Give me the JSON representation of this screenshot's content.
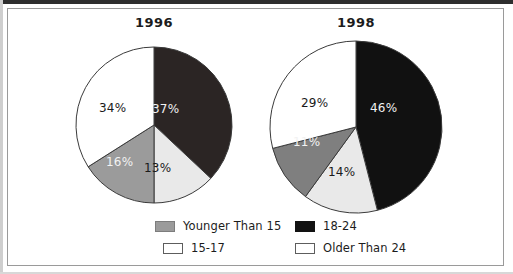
{
  "chart_data": [
    {
      "type": "pie",
      "title": "1996",
      "categories": [
        "18-24",
        "15-17",
        "Younger Than 15",
        "Older Than 24"
      ],
      "values": [
        37,
        13,
        16,
        34
      ],
      "labels": [
        "37%",
        "13%",
        "16%",
        "34%"
      ],
      "colors": [
        "#2b2524",
        "#e9e9e9",
        "#9b9b9b",
        "#ffffff"
      ],
      "label_colors": [
        "light",
        "dark",
        "light",
        "dark"
      ],
      "start_angle_deg": 0,
      "direction": "clockwise",
      "units": "percent",
      "legend_position": "bottom"
    },
    {
      "type": "pie",
      "title": "1998",
      "categories": [
        "18-24",
        "15-17",
        "Younger Than 15",
        "Older Than 24"
      ],
      "values": [
        46,
        14,
        11,
        29
      ],
      "labels": [
        "46%",
        "14%",
        "11%",
        "29%"
      ],
      "colors": [
        "#111111",
        "#e9e9e9",
        "#7f7f7f",
        "#ffffff"
      ],
      "label_colors": [
        "light",
        "dark",
        "light",
        "dark"
      ],
      "start_angle_deg": 0,
      "direction": "clockwise",
      "units": "percent",
      "legend_position": "bottom"
    }
  ],
  "charts": {
    "left": {
      "title": "1996",
      "slices": [
        {
          "label": "37%",
          "value": 37,
          "category": "18-24"
        },
        {
          "label": "13%",
          "value": 13,
          "category": "15-17"
        },
        {
          "label": "16%",
          "value": 16,
          "category": "Younger Than 15"
        },
        {
          "label": "34%",
          "value": 34,
          "category": "Older Than 24"
        }
      ]
    },
    "right": {
      "title": "1998",
      "slices": [
        {
          "label": "46%",
          "value": 46,
          "category": "18-24"
        },
        {
          "label": "14%",
          "value": 14,
          "category": "15-17"
        },
        {
          "label": "11%",
          "value": 11,
          "category": "Younger Than 15"
        },
        {
          "label": "29%",
          "value": 29,
          "category": "Older Than 24"
        }
      ]
    }
  },
  "legend": {
    "items": [
      {
        "label": "Younger Than 15",
        "swatch": "gray",
        "color": "#9b9b9b"
      },
      {
        "label": "18-24",
        "swatch": "black",
        "color": "#121212"
      },
      {
        "label": "15-17",
        "swatch": "white",
        "color": "#ffffff"
      },
      {
        "label": "Older Than 24",
        "swatch": "white",
        "color": "#ffffff"
      }
    ]
  },
  "colors": {
    "background": "#ffffff",
    "frame_border": "#9a9a9a",
    "text": "#1c1c1c",
    "slice_black": "#121212",
    "slice_gray": "#9b9b9b",
    "slice_light": "#e9e9e9",
    "slice_white": "#ffffff"
  }
}
